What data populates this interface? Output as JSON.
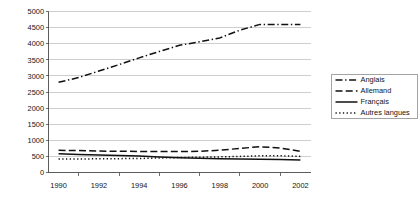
{
  "chart_data": {
    "type": "line",
    "title": "",
    "subtitle": "",
    "xlabel": "",
    "ylabel": "",
    "x": [
      1990,
      1991,
      1992,
      1993,
      1994,
      1995,
      1996,
      1997,
      1998,
      1999,
      2000,
      2001,
      2002
    ],
    "xlim": [
      1989.5,
      2002.5
    ],
    "ylim": [
      0,
      5000
    ],
    "y_ticks": [
      0,
      500,
      1000,
      1500,
      2000,
      2500,
      3000,
      3500,
      4000,
      4500,
      5000
    ],
    "y_tick_labels": [
      "0",
      "500",
      "1000",
      "1500",
      "2000",
      "2500",
      "3000",
      "3500",
      "4000",
      "4500",
      "5000"
    ],
    "x_ticks": [
      1990,
      1992,
      1994,
      1996,
      1998,
      2000,
      2002
    ],
    "x_tick_labels": [
      "1990",
      "1992",
      "1994",
      "1996",
      "1998",
      "2000",
      "2002"
    ],
    "x_minor_ticks": [
      1991,
      1993,
      1995,
      1997,
      1999,
      2001
    ],
    "grid": "horizontal",
    "legend_position": "right",
    "series": [
      {
        "name": "Anglais",
        "dash": "dashdot",
        "stroke_width": 1.5,
        "values": [
          2800,
          2950,
          3150,
          3350,
          3560,
          3760,
          3950,
          4060,
          4180,
          4420,
          4600,
          4600,
          4600
        ]
      },
      {
        "name": "Allemand",
        "dash": "dashed",
        "stroke_width": 1.5,
        "values": [
          690,
          680,
          665,
          660,
          655,
          650,
          650,
          660,
          690,
          750,
          800,
          760,
          660
        ]
      },
      {
        "name": "Français",
        "dash": "solid",
        "stroke_width": 1.5,
        "values": [
          580,
          560,
          545,
          530,
          510,
          480,
          455,
          440,
          430,
          420,
          415,
          400,
          390
        ]
      },
      {
        "name": "Autres langues",
        "dash": "dotted",
        "stroke_width": 1.5,
        "values": [
          420,
          420,
          425,
          430,
          435,
          450,
          465,
          475,
          485,
          500,
          520,
          520,
          500
        ]
      }
    ]
  },
  "legend": {
    "entries": [
      {
        "label": "Anglais"
      },
      {
        "label": "Allemand"
      },
      {
        "label": "Français"
      },
      {
        "label": "Autres langues"
      }
    ]
  },
  "colors": {
    "background": "#ffffff",
    "line": "#111111",
    "gridline": "#b9b9b9",
    "axis": "#4a4a4a",
    "text": "#141414"
  }
}
